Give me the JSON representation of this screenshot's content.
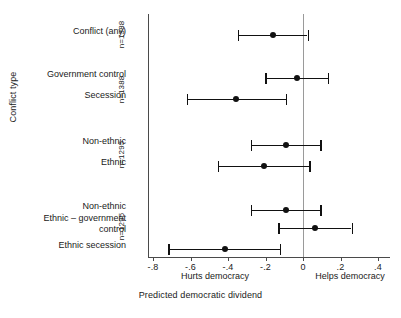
{
  "chart_data": {
    "type": "scatter",
    "title": "",
    "xlabel": "Predicted democratic dividend",
    "ylabel": "Conflict type",
    "xlim": [
      -0.88,
      0.44
    ],
    "xticks": [
      -0.8,
      -0.6,
      -0.4,
      -0.2,
      0,
      0.2,
      0.4
    ],
    "xticklabels": [
      "-.8",
      "-.6",
      "-.4",
      "-.2",
      "0",
      ".2",
      ".4"
    ],
    "grid": false,
    "legend": "none",
    "reference_line": 0,
    "annotations": {
      "left_caption": "Hurts democracy",
      "right_caption": "Helps democracy"
    },
    "groups": [
      {
        "n_label": "n=1388",
        "categories": [
          "Conflict (any)"
        ],
        "estimates": [
          -0.2
        ],
        "ci_low": [
          -0.39
        ],
        "ci_high": [
          -0.01
        ]
      },
      {
        "n_label": "n=1388",
        "categories": [
          "Government control",
          "Secession"
        ],
        "estimates": [
          -0.07,
          -0.4
        ],
        "ci_low": [
          -0.24,
          -0.67
        ],
        "ci_high": [
          0.1,
          -0.13
        ]
      },
      {
        "n_label": "n=1295",
        "categories": [
          "Non-ethnic",
          "Ethnic"
        ],
        "estimates": [
          -0.13,
          -0.25
        ],
        "ci_low": [
          -0.32,
          -0.5
        ],
        "ci_high": [
          0.06,
          0.0
        ]
      },
      {
        "n_label": "n=1295",
        "categories": [
          "Non-ethnic",
          "Ethnic – government control",
          "Ethnic secession"
        ],
        "estimates": [
          -0.13,
          0.03,
          -0.46
        ],
        "ci_low": [
          -0.32,
          -0.17,
          -0.77
        ],
        "ci_high": [
          0.06,
          0.23,
          -0.16
        ]
      }
    ]
  },
  "axes": {
    "y_title": "Conflict type",
    "x_title": "Predicted democratic dividend",
    "tick_labels": {
      "t0": "-.8",
      "t1": "-.6",
      "t2": "-.4",
      "t3": "-.2",
      "t4": "0",
      "t5": ".2",
      "t6": ".4"
    }
  },
  "captions": {
    "hurts": "Hurts democracy",
    "helps": "Helps democracy"
  },
  "categories": {
    "c0": "Conflict (any)",
    "c1": "Government control",
    "c2": "Secession",
    "c3": "Non-ethnic",
    "c4": "Ethnic",
    "c5": "Non-ethnic",
    "c6": "Ethnic – government\ncontrol",
    "c7": "Ethnic secession"
  },
  "group_labels": {
    "g0": "n=1388",
    "g1": "n=1388",
    "g2": "n=1295",
    "g3": "n=1295"
  }
}
